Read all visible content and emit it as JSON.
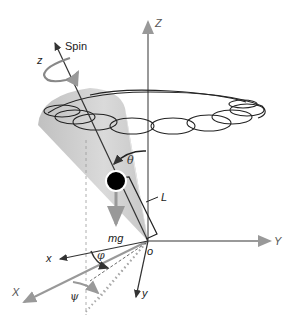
{
  "diagram": {
    "colors": {
      "axes_grey": "#999999",
      "cone_light": "#d4d4d4",
      "cone_dark": "#b0b0b0",
      "ink": "#222222",
      "mass": "#000000"
    },
    "labels": {
      "spin": "Spin",
      "z_body": "z",
      "Z_lab": "Z",
      "Y_lab": "Y",
      "X_lab": "X",
      "x_body": "x",
      "y_body": "y",
      "origin": "o",
      "theta": "θ",
      "phi": "φ",
      "psi": "ψ",
      "L": "L",
      "mg": "mg"
    },
    "elements": [
      "lab-frame axes X, Y, Z (grey arrows)",
      "body-frame axes x, y, z (dark arrows)",
      "spin rotation arrow about z",
      "precession cone (shaded)",
      "nutation loop trajectory (cycloidal loops around ellipse)",
      "center of mass (black disc) with weight mg",
      "lever arm length L bracket",
      "tilt angle θ arc",
      "angles φ and ψ in the horizontal plane"
    ]
  }
}
